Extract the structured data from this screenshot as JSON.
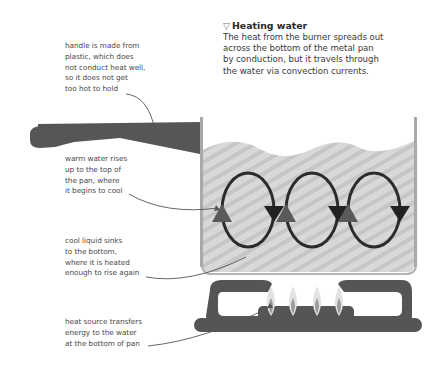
{
  "header": {
    "marker_icon": "triangle-down-outline",
    "title": "Heating water",
    "description_lines": [
      "The heat from the burner spreads out",
      "across the bottom of the metal pan",
      "by conduction, but it travels through",
      "the water via convection currents."
    ]
  },
  "annotations": [
    {
      "id": "handle",
      "lines": [
        "handle is made from",
        "plastic, which does",
        "not conduct heat well,",
        "so it does not get",
        "too hot to hold"
      ]
    },
    {
      "id": "warm-water",
      "lines": [
        "warm water rises",
        "up to the top of",
        "the pan, where",
        "it begins to cool"
      ]
    },
    {
      "id": "cool-liquid",
      "lines": [
        "cool liquid sinks",
        "to the bottom,",
        "where it is heated",
        "enough to rise again"
      ]
    },
    {
      "id": "heat-source",
      "lines": [
        "heat source transfers",
        "energy to the water",
        "at the bottom of pan"
      ]
    }
  ],
  "illustration": {
    "convection_loops": 3,
    "flames": 4,
    "colors": {
      "handle": "#555555",
      "pan_wall": "#a9a9a9",
      "water": "#d6d6d6",
      "water_stripe": "#c4c4c4",
      "loop": "#2b2b2b",
      "arrow_down": "#222222",
      "arrow_up": "#5a5a5a",
      "burner": "#555555",
      "flame_outer": "#d9d9d9",
      "flame_inner": "#9a9a9a",
      "leader_line": "#555555"
    }
  }
}
